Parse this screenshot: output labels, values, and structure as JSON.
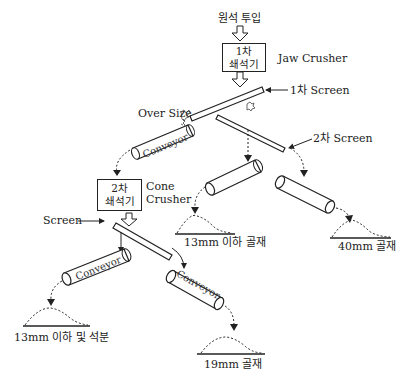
{
  "diagram": {
    "input_label": "원석 투입",
    "primary_crusher": {
      "line1": "1차",
      "line2": "쇄석기",
      "type": "Jaw Crusher"
    },
    "primary_screen_label": "1차 Screen",
    "oversize_label": "Over Size",
    "secondary_screen_label": "2차 Screen",
    "secondary_crusher": {
      "line1": "2차",
      "line2": "쇄석기",
      "type_line1": "Cone",
      "type_line2": "Crusher"
    },
    "tertiary_screen_label": "Screen",
    "conveyors": {
      "top_left": "Conveyor",
      "bottom_left": "Conveyor",
      "bottom_middle": "Conveyor"
    },
    "products": {
      "p13_mid": "13mm 이하 골재",
      "p40": "40mm 골재",
      "p13_fines": "13mm 이하 및 석분",
      "p19": "19mm 골재"
    },
    "colors": {
      "line": "#222222",
      "background": "#ffffff"
    }
  }
}
